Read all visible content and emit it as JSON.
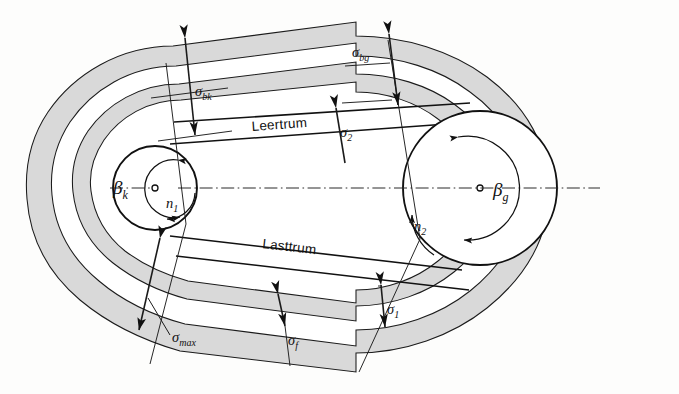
{
  "figure": {
    "background_color": "#fdfdfc",
    "band_fill_color": "#d9d9d9",
    "line_color": "#111111"
  },
  "labels": {
    "sigma_bk": {
      "symbol": "σ",
      "subscript": "bk",
      "x": 204,
      "y": 91
    },
    "sigma_bg": {
      "symbol": "σ",
      "subscript": "bg",
      "x": 366,
      "y": 52
    },
    "sigma_2": {
      "symbol": "σ",
      "subscript": "2",
      "x": 345,
      "y": 132
    },
    "sigma_1": {
      "symbol": "σ",
      "subscript": "1",
      "x": 388,
      "y": 316
    },
    "sigma_f": {
      "symbol": "σ",
      "subscript": "f",
      "x": 287,
      "y": 345
    },
    "sigma_max": {
      "symbol": "σ",
      "subscript": "max",
      "x": 172,
      "y": 340
    },
    "beta_k": {
      "symbol": "β",
      "subscript": "k",
      "x": 120,
      "y": 193
    },
    "beta_g": {
      "symbol": "β",
      "subscript": "g",
      "x": 500,
      "y": 194
    },
    "n1": {
      "symbol": "n",
      "subscript": "1",
      "x": 171,
      "y": 207
    },
    "n2": {
      "symbol": "n",
      "subscript": "2",
      "x": 420,
      "y": 229
    },
    "leertrum": {
      "text": "Leertrum",
      "x": 252,
      "y": 128
    },
    "lasttrum": {
      "text": "Lasttrum",
      "x": 262,
      "y": 249
    }
  },
  "geometry": {
    "small_pulley": {
      "cx": 155,
      "cy": 188,
      "r": 42,
      "label": "driving-pulley"
    },
    "large_pulley": {
      "cx": 480,
      "cy": 188,
      "r": 77,
      "label": "driven-pulley"
    },
    "centerline_y": 188,
    "centerline_x_start": 178,
    "centerline_x_end": 600
  },
  "annotations": {
    "diagram_kind": "machine-element-technical-drawing",
    "subject": "belt tension and bending stress distribution around two pulleys"
  }
}
